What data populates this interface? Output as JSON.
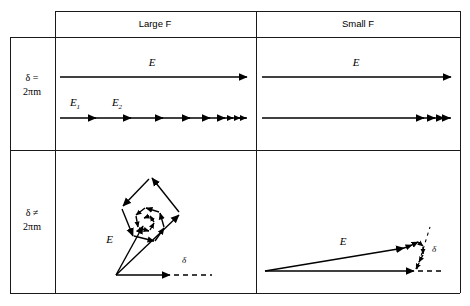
{
  "figure": {
    "kind": "vector-phasor-diagram-table",
    "background": "#ffffff",
    "line_color": "#000000",
    "border_color": "#1a1a1a"
  },
  "table": {
    "columns": [
      {
        "id": "large-f",
        "label": "Large F"
      },
      {
        "id": "small-f",
        "label": "Small F"
      }
    ],
    "rows": [
      {
        "id": "delta-equal",
        "label_line1": "δ =",
        "label_line2": "2πm"
      },
      {
        "id": "delta-not-equal",
        "label_line1": "δ ≠",
        "label_line2": "2πm"
      }
    ]
  },
  "cells": {
    "large_f_in_phase": {
      "resultant_label": "E",
      "component_labels": [
        "E",
        "E"
      ],
      "component_subscripts": [
        "1",
        "2"
      ],
      "arrowhead_count": 11,
      "description": "collinear component vectors summing to long resultant E"
    },
    "small_f_in_phase": {
      "resultant_label": "E",
      "arrowhead_count": 4,
      "description": "collinear short component vectors summing to long resultant E"
    },
    "large_f_out_phase": {
      "resultant_label": "E",
      "angle_label": "δ",
      "description": "component vectors form an inward spiral polygon, resultant E short"
    },
    "small_f_out_phase": {
      "resultant_label": "E",
      "angle_label": "δ",
      "description": "component vectors nearly collinear with small closing spiral, resultant E long"
    }
  }
}
